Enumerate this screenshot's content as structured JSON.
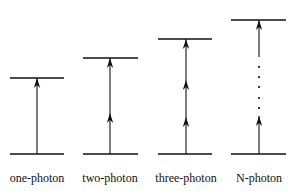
{
  "diagram": {
    "type": "energy-level transitions",
    "ground_level_y": 154,
    "line_color": "#111111",
    "panels": [
      {
        "label": "one-photon",
        "photons": 1,
        "top_y": 78,
        "x_left": 10,
        "x_right": 64,
        "x_center": 37,
        "arrow_tips": [
          78
        ]
      },
      {
        "label": "two-photon",
        "photons": 2,
        "top_y": 58,
        "x_left": 83,
        "x_right": 138,
        "x_center": 110,
        "arrow_tips": [
          58,
          113
        ]
      },
      {
        "label": "three-photon",
        "photons": 3,
        "top_y": 39,
        "x_left": 158,
        "x_right": 212,
        "x_center": 186,
        "arrow_tips": [
          39,
          80,
          117
        ]
      },
      {
        "label": "N-photon",
        "photons": "N",
        "top_y": 20,
        "x_left": 231,
        "x_right": 286,
        "x_center": 259,
        "arrow_tips": [
          20,
          116
        ],
        "dots_y": [
          67,
          77,
          87,
          98,
          108
        ]
      }
    ]
  }
}
